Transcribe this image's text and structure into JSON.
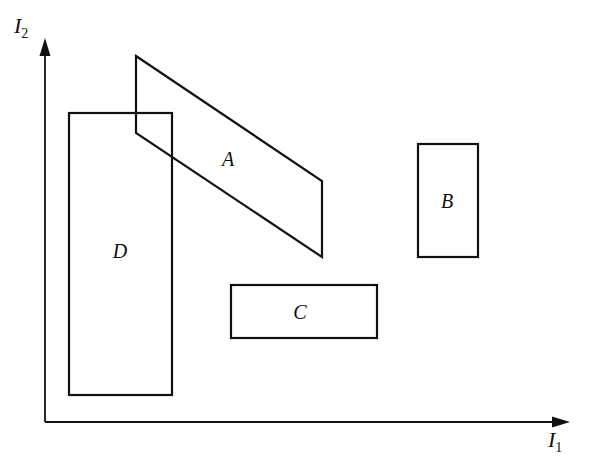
{
  "axes": {
    "x_label": "I",
    "x_subscript": "1",
    "y_label": "I",
    "y_subscript": "2"
  },
  "regions": [
    {
      "id": "A",
      "label": "A",
      "shape": "parallelogram",
      "points": [
        [
          136,
          56
        ],
        [
          322,
          181
        ],
        [
          322,
          257
        ],
        [
          136,
          133
        ]
      ],
      "label_pos": [
        228,
        163
      ]
    },
    {
      "id": "B",
      "label": "B",
      "shape": "rectangle",
      "x": 418,
      "y": 144,
      "width": 60,
      "height": 113,
      "label_pos": [
        447,
        207
      ]
    },
    {
      "id": "C",
      "label": "C",
      "shape": "rectangle",
      "x": 231,
      "y": 285,
      "width": 146,
      "height": 53,
      "label_pos": [
        300,
        318
      ]
    },
    {
      "id": "D",
      "label": "D",
      "shape": "rectangle",
      "x": 69,
      "y": 113,
      "width": 103,
      "height": 282,
      "label_pos": [
        120,
        258
      ]
    }
  ],
  "colors": {
    "ink": "#111111",
    "background": "#ffffff"
  }
}
